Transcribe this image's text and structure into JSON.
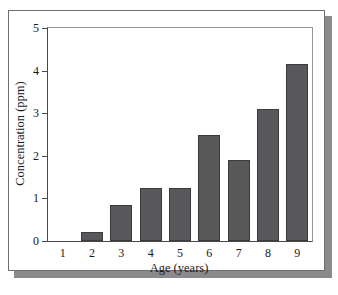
{
  "chart_data": {
    "type": "bar",
    "title": "",
    "xlabel": "Age (years)",
    "ylabel": "Concentration (ppm)",
    "categories": [
      "1",
      "2",
      "3",
      "4",
      "5",
      "6",
      "7",
      "8",
      "9"
    ],
    "values": [
      0,
      0.2,
      0.85,
      1.25,
      1.25,
      2.5,
      1.9,
      3.1,
      4.15
    ],
    "ylim": [
      0,
      5
    ],
    "yticks": [
      "0",
      "1",
      "2",
      "3",
      "4",
      "5"
    ],
    "ytick_values": [
      0,
      1,
      2,
      3,
      4,
      5
    ],
    "grid": false,
    "legend": null,
    "bar_color": "#58585a",
    "bar_edge_color": "#3c3c3e",
    "axis_color": "#4a4a4c",
    "background_color": "#ffffff",
    "frame_color": "#6e6e70",
    "shadow_color": "#8a8a8c"
  }
}
